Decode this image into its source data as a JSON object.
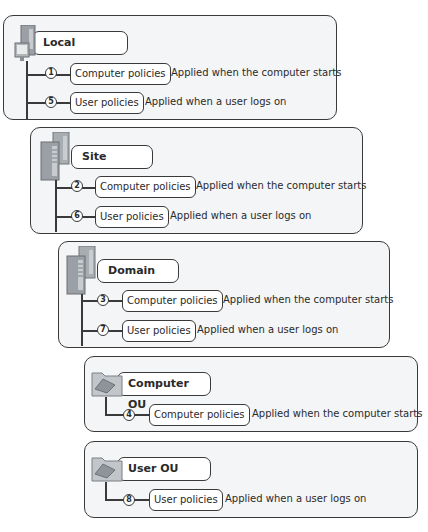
{
  "diagram": {
    "type": "group-policy-processing-order",
    "levels": [
      {
        "title": "Local",
        "icon": "computer-icon",
        "policies": [
          {
            "order": "1",
            "label": "Computer policies",
            "description": "Applied when the computer starts"
          },
          {
            "order": "5",
            "label": "User policies",
            "description": "Applied when a user logs on"
          }
        ]
      },
      {
        "title": "Site",
        "icon": "server-icon",
        "policies": [
          {
            "order": "2",
            "label": "Computer policies",
            "description": "Applied when the computer starts"
          },
          {
            "order": "6",
            "label": "User policies",
            "description": "Applied when a user logs on"
          }
        ]
      },
      {
        "title": "Domain",
        "icon": "server-icon",
        "policies": [
          {
            "order": "3",
            "label": "Computer policies",
            "description": "Applied when the computer starts"
          },
          {
            "order": "7",
            "label": "User policies",
            "description": "Applied when a user logs on"
          }
        ]
      },
      {
        "title": "Computer OU",
        "icon": "folder-icon",
        "policies": [
          {
            "order": "4",
            "label": "Computer policies",
            "description": "Applied when the computer starts"
          }
        ]
      },
      {
        "title": "User OU",
        "icon": "folder-icon",
        "policies": [
          {
            "order": "8",
            "label": "User policies",
            "description": "Applied when a user logs on"
          }
        ]
      }
    ]
  }
}
